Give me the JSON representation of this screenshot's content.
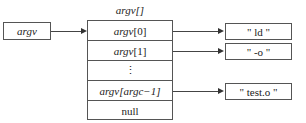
{
  "pointer": {
    "label": "argv"
  },
  "array": {
    "title": "argv[]",
    "cells": [
      {
        "name": "argv",
        "index": "[0]"
      },
      {
        "name": "argv",
        "index": "[1]"
      },
      {
        "name": "",
        "index": "⋮"
      },
      {
        "name": "argv",
        "index": "[argc−1]"
      },
      {
        "name": "",
        "index": "null"
      }
    ]
  },
  "strings": [
    {
      "text": "\" ld \""
    },
    {
      "text": "\" -o \""
    },
    {
      "text": "\" test.o \""
    }
  ]
}
